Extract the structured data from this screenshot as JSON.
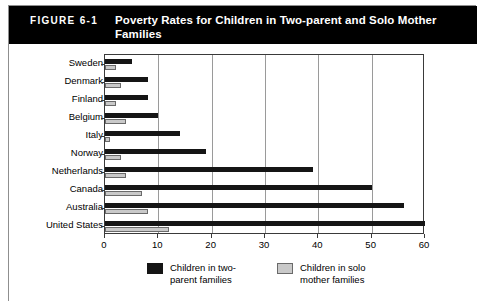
{
  "figure": {
    "number": "FIGURE 6-1",
    "title": "Poverty Rates for Children in Two-parent and Solo Mother Families"
  },
  "legend": {
    "series_one": "Children in two-\nparent families",
    "series_two": "Children in solo\nmother families"
  },
  "colors": {
    "header_background": "#000000",
    "header_text": "#ffffff",
    "two_parent_bar": "#151515",
    "solo_mother_bar": "#c9c9c9",
    "gridline": "#9a9a9a",
    "axis": "#3a3a3a",
    "frame": "#8f8f8f"
  },
  "chart_data": {
    "type": "bar",
    "orientation": "horizontal",
    "title": "Poverty Rates for Children in Two-parent and Solo Mother Families",
    "xlabel": "",
    "ylabel": "",
    "xlim": [
      0,
      60
    ],
    "xticks": [
      0,
      10,
      20,
      30,
      40,
      50,
      60
    ],
    "grid": true,
    "legend_position": "bottom",
    "categories": [
      "Sweden",
      "Denmark",
      "Finland",
      "Belgium",
      "Italy",
      "Norway",
      "Netherlands",
      "Canada",
      "Australia",
      "United States"
    ],
    "series": [
      {
        "name": "Children in two-parent families",
        "values": [
          5,
          8,
          8,
          10,
          14,
          19,
          39,
          50,
          56,
          60
        ]
      },
      {
        "name": "Children in solo mother families",
        "values": [
          2,
          3,
          2,
          4,
          1,
          3,
          4,
          7,
          8,
          12
        ]
      }
    ]
  }
}
